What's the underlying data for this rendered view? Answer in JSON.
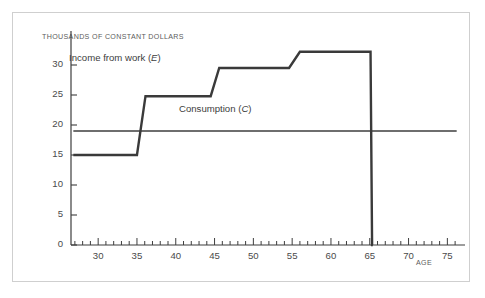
{
  "figure": {
    "y_axis_title": "THOUSANDS OF CONSTANT DOLLARS",
    "x_axis_title": "AGE"
  },
  "chart_data": {
    "type": "line",
    "title": "",
    "xlabel": "AGE",
    "ylabel": "THOUSANDS OF CONSTANT DOLLARS",
    "xlim": [
      26.5,
      76.5
    ],
    "ylim": [
      0,
      34
    ],
    "grid": false,
    "legend": "inline-annotations",
    "x_ticks": [
      30,
      35,
      40,
      45,
      50,
      55,
      60,
      65,
      70,
      75
    ],
    "x_minor_tick_step": 1,
    "y_ticks": [
      0,
      5,
      10,
      15,
      20,
      25,
      30
    ],
    "series": [
      {
        "name": "Income from work (E)",
        "label_text": "Income from work (",
        "label_symbol": "E",
        "label_close": ")",
        "color": "#3a3a3a",
        "linewidth": 2.4,
        "type": "step-with-ramps",
        "points": [
          [
            26.8,
            15.0
          ],
          [
            35.0,
            15.0
          ],
          [
            36.1,
            24.8
          ],
          [
            44.5,
            24.8
          ],
          [
            45.6,
            29.5
          ],
          [
            54.6,
            29.5
          ],
          [
            56.0,
            32.2
          ],
          [
            65.1,
            32.2
          ],
          [
            65.3,
            0.0
          ],
          [
            65.4,
            0.0
          ]
        ]
      },
      {
        "name": "Consumption (C)",
        "label_text": "Consumption (",
        "label_symbol": "C",
        "label_close": ")",
        "color": "#6e6e6e",
        "linewidth": 1.9,
        "type": "horizontal",
        "value": 19.0,
        "points": [
          [
            26.8,
            19.0
          ],
          [
            76.2,
            19.0
          ]
        ]
      }
    ],
    "annotations": [
      {
        "text": "Income from work (E)",
        "x": 36.5,
        "y": 30.2
      },
      {
        "text": "Consumption (C)",
        "x": 48.5,
        "y": 21.0
      }
    ]
  }
}
